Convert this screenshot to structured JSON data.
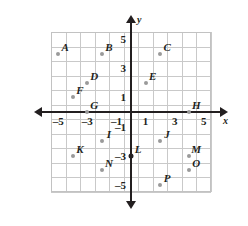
{
  "chart_data": {
    "type": "scatter",
    "title": "",
    "xlabel": "x",
    "ylabel": "y",
    "xlim": [
      -5.5,
      5.5
    ],
    "ylim": [
      -5.5,
      5.5
    ],
    "grid": true,
    "legend": "none",
    "grid_step": 1,
    "x_ticks": [
      -5,
      -3,
      -1,
      1,
      3,
      5
    ],
    "y_ticks": [
      5,
      3,
      1,
      -1,
      -3,
      -5
    ],
    "x_tick_labels": [
      "–5",
      "–3",
      "–1",
      "1",
      "3",
      "5"
    ],
    "y_tick_labels": [
      "5",
      "3",
      "1",
      "–1",
      "–3",
      "–5"
    ],
    "points": [
      {
        "label": "A",
        "x": -5,
        "y": 4,
        "style": "open"
      },
      {
        "label": "B",
        "x": -2,
        "y": 4,
        "style": "open"
      },
      {
        "label": "C",
        "x": 2,
        "y": 4,
        "style": "open"
      },
      {
        "label": "D",
        "x": -3,
        "y": 2,
        "style": "open"
      },
      {
        "label": "E",
        "x": 1,
        "y": 2,
        "style": "open"
      },
      {
        "label": "F",
        "x": -4,
        "y": 1,
        "style": "open"
      },
      {
        "label": "G",
        "x": -3,
        "y": 0,
        "style": "open"
      },
      {
        "label": "H",
        "x": 4,
        "y": 0,
        "style": "open"
      },
      {
        "label": "I",
        "x": -2,
        "y": -2,
        "style": "open"
      },
      {
        "label": "J",
        "x": 2,
        "y": -2,
        "style": "open"
      },
      {
        "label": "K",
        "x": -4,
        "y": -3,
        "style": "open"
      },
      {
        "label": "L",
        "x": 0,
        "y": -3,
        "style": "solid"
      },
      {
        "label": "M",
        "x": 4,
        "y": -3,
        "style": "open"
      },
      {
        "label": "N",
        "x": -2,
        "y": -4,
        "style": "open"
      },
      {
        "label": "O",
        "x": 4,
        "y": -4,
        "style": "open"
      },
      {
        "label": "P",
        "x": 2,
        "y": -5,
        "style": "open"
      }
    ],
    "colors": {
      "axis": "#231f20",
      "grid": "#c9c9c9",
      "point": "#9a9a9a",
      "point_solid": "#231f20",
      "background": "#ffffff"
    }
  }
}
